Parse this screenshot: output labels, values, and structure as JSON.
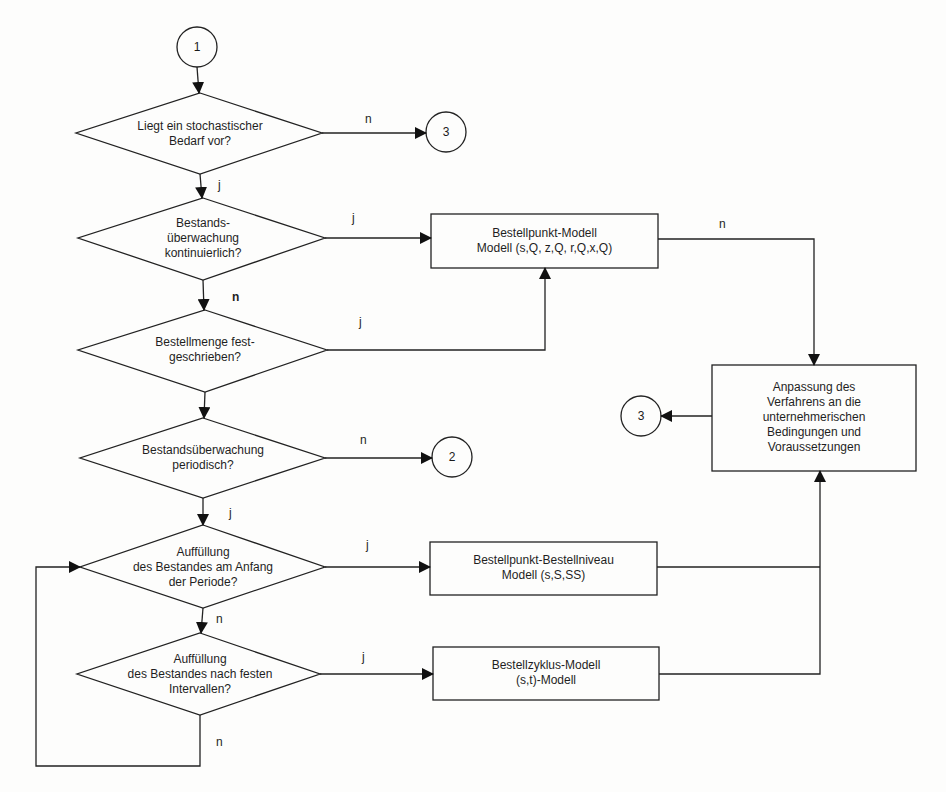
{
  "connectors": {
    "start": "1",
    "to_3_top": "3",
    "to_2": "2",
    "to_3_right": "3"
  },
  "decisions": [
    {
      "id": "d1",
      "lines": [
        "Liegt ein stochastischer",
        "Bedarf vor?"
      ]
    },
    {
      "id": "d2",
      "lines": [
        "Bestands-",
        "überwachung",
        "kontinuierlich?"
      ]
    },
    {
      "id": "d3",
      "lines": [
        "Bestellmenge fest-",
        "geschrieben?"
      ]
    },
    {
      "id": "d4",
      "lines": [
        "Bestandsüberwachung",
        "periodisch?"
      ]
    },
    {
      "id": "d5",
      "lines": [
        "Auffüllung",
        "des Bestandes am Anfang",
        "der Periode?"
      ]
    },
    {
      "id": "d6",
      "lines": [
        "Auffüllung",
        "des Bestandes nach festen",
        "Intervallen?"
      ]
    }
  ],
  "processes": [
    {
      "id": "p1",
      "line1": "Bestellpunkt-Modell",
      "line2": "Modell (s,Q, z,Q, r,Q,x,Q)"
    },
    {
      "id": "p2",
      "line1": "Bestellpunkt-Bestellniveau",
      "line2": "Modell (s,S,SS)"
    },
    {
      "id": "p3",
      "line1": "Bestellzyklus-Modell",
      "line2": "(s,t)-Modell"
    },
    {
      "id": "p4",
      "lines": [
        "Anpassung des",
        "Verfahrens an die",
        "unternehmerischen",
        "Bedingungen und",
        "Voraussetzungen"
      ]
    }
  ],
  "edge_labels": {
    "d1_no": "n",
    "d1_yes": "j",
    "d2_yes": "j",
    "d2_no": "n",
    "p1_out": "n",
    "d3_yes": "j",
    "d4_no": "n",
    "d4_yes": "j",
    "d5_yes": "j",
    "d5_no": "n",
    "d6_yes": "j",
    "d6_no": "n"
  }
}
